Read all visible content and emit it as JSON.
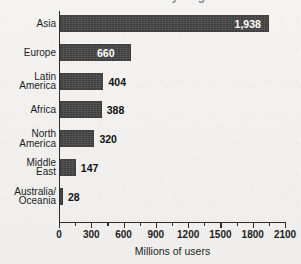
{
  "chart_data": {
    "type": "bar",
    "orientation": "horizontal",
    "title": "Internet Users by Region",
    "title_visible": false,
    "categories": [
      "Asia",
      "Europe",
      "Latin\nAmerica",
      "Africa",
      "North\nAmerica",
      "Middle\nEast",
      "Australia/\nOceania"
    ],
    "values": [
      1938,
      660,
      404,
      388,
      320,
      147,
      28
    ],
    "value_labels": [
      "1,938",
      "660",
      "404",
      "388",
      "320",
      "147",
      "28"
    ],
    "xlabel": "Millions of users",
    "ylabel": "",
    "xlim": [
      0,
      2100
    ],
    "xticks": [
      0,
      300,
      600,
      900,
      1200,
      1500,
      1800,
      2100
    ],
    "xtick_labels": [
      "0",
      "300",
      "600",
      "900",
      "1200",
      "1500",
      "1800",
      "2100"
    ],
    "minor_tick_step": 150,
    "grid": false,
    "legend": null,
    "bar_color": "#454545",
    "text_color": "#1b1b1b",
    "background_color": "#f2f1ef"
  }
}
